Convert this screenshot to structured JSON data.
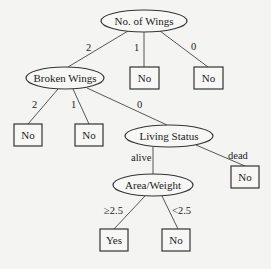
{
  "diagram": {
    "type": "decision-tree",
    "nodes": {
      "root": {
        "label": "No. of Wings",
        "shape": "ellipse"
      },
      "broken_wings": {
        "label": "Broken Wings",
        "shape": "ellipse"
      },
      "wings1_leaf": {
        "label": "No",
        "shape": "box"
      },
      "wings0_leaf": {
        "label": "No",
        "shape": "box"
      },
      "bw2_leaf": {
        "label": "No",
        "shape": "box"
      },
      "bw1_leaf": {
        "label": "No",
        "shape": "box"
      },
      "living_status": {
        "label": "Living Status",
        "shape": "ellipse"
      },
      "dead_leaf": {
        "label": "No",
        "shape": "box"
      },
      "area_weight": {
        "label": "Area/Weight",
        "shape": "ellipse"
      },
      "ge_leaf": {
        "label": "Yes",
        "shape": "box"
      },
      "lt_leaf": {
        "label": "No",
        "shape": "box"
      }
    },
    "edges": {
      "root_to_bw": {
        "label": "2"
      },
      "root_to_w1": {
        "label": "1"
      },
      "root_to_w0": {
        "label": "0"
      },
      "bw_to_2": {
        "label": "2"
      },
      "bw_to_1": {
        "label": "1"
      },
      "bw_to_ls": {
        "label": "0"
      },
      "ls_to_aw": {
        "label": "alive"
      },
      "ls_to_dead": {
        "label": "dead"
      },
      "aw_to_yes": {
        "label": "≥2.5"
      },
      "aw_to_no": {
        "label": "<2.5"
      }
    }
  }
}
